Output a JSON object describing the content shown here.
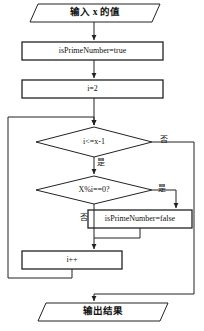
{
  "diagram": {
    "language": "zh-CN",
    "stroke_color": "#222222",
    "background_color": "#ffffff",
    "nodes": {
      "input": {
        "label": "输入 x 的值",
        "shape": "parallelogram"
      },
      "init_flag": {
        "label": "isPrimeNumber=true",
        "shape": "rectangle"
      },
      "init_i": {
        "label": "i=2",
        "shape": "rectangle"
      },
      "loop_cond": {
        "label": "i<=x-1",
        "shape": "diamond"
      },
      "mod_cond": {
        "label": "X%i==0?",
        "shape": "diamond"
      },
      "set_false": {
        "label": "isPrimeNumber=false",
        "shape": "rectangle"
      },
      "increment": {
        "label": "i++",
        "shape": "rectangle"
      },
      "output": {
        "label": "输出结果",
        "shape": "parallelogram"
      }
    },
    "edge_labels": {
      "loop_no": "否",
      "loop_yes": "是",
      "mod_yes": "是",
      "mod_no": "否"
    }
  }
}
